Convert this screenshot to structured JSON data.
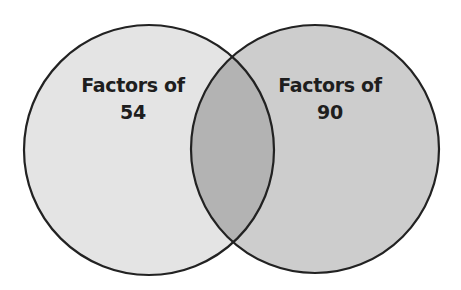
{
  "diagram": {
    "type": "venn",
    "sets": [
      {
        "id": "left",
        "label_line1": "Factors of",
        "label_line2": "54",
        "fill": "#e4e4e4",
        "center": [
          149,
          150
        ],
        "radius": 125
      },
      {
        "id": "right",
        "label_line1": "Factors of",
        "label_line2": "90",
        "fill": "#cdcdcd",
        "center": [
          315,
          149
        ],
        "radius": 124
      }
    ],
    "overlap_fill": "#b3b3b3",
    "stroke": "#222222"
  }
}
